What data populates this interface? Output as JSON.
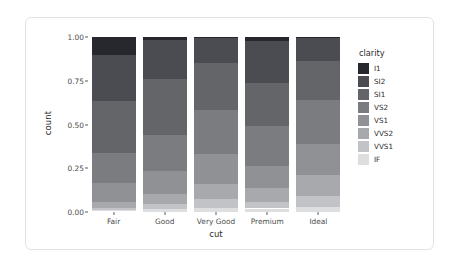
{
  "chart_data": {
    "type": "bar",
    "title": "",
    "subtitle": "",
    "xlabel": "cut",
    "ylabel": "count",
    "categories": [
      "Fair",
      "Good",
      "Very Good",
      "Premium",
      "Ideal"
    ],
    "stacked": true,
    "position": "fill",
    "ylim": [
      0.0,
      1.0
    ],
    "ytick_labels": [
      "0.00",
      "0.25",
      "0.50",
      "0.75",
      "1.00"
    ],
    "ytick_values": [
      0.0,
      0.25,
      0.5,
      0.75,
      1.0
    ],
    "grid": false,
    "legend_title": "clarity",
    "legend_position": "right",
    "series": [
      {
        "name": "I1",
        "color": "#27282d",
        "values": [
          0.104,
          0.015,
          0.008,
          0.021,
          0.007
        ]
      },
      {
        "name": "SI2",
        "color": "#4a4c52",
        "values": [
          0.264,
          0.224,
          0.141,
          0.244,
          0.129
        ]
      },
      {
        "name": "SI1",
        "color": "#646569",
        "values": [
          0.297,
          0.321,
          0.268,
          0.243,
          0.224
        ]
      },
      {
        "name": "VS2",
        "color": "#7b7c80",
        "values": [
          0.169,
          0.205,
          0.251,
          0.229,
          0.254
        ]
      },
      {
        "name": "VS1",
        "color": "#909195",
        "values": [
          0.107,
          0.132,
          0.172,
          0.128,
          0.176
        ]
      },
      {
        "name": "VVS2",
        "color": "#a8a9ad",
        "values": [
          0.035,
          0.056,
          0.086,
          0.079,
          0.12
        ]
      },
      {
        "name": "VVS1",
        "color": "#c2c3c6",
        "values": [
          0.011,
          0.03,
          0.052,
          0.036,
          0.063
        ]
      },
      {
        "name": "IF",
        "color": "#dddee0",
        "values": [
          0.006,
          0.017,
          0.022,
          0.019,
          0.028
        ]
      }
    ],
    "legend_entries": [
      {
        "label": "I1",
        "color": "#27282d"
      },
      {
        "label": "SI2",
        "color": "#4a4c52"
      },
      {
        "label": "SI1",
        "color": "#646569"
      },
      {
        "label": "VS2",
        "color": "#7b7c80"
      },
      {
        "label": "VS1",
        "color": "#909195"
      },
      {
        "label": "VVS2",
        "color": "#a8a9ad"
      },
      {
        "label": "VVS1",
        "color": "#c2c3c6"
      },
      {
        "label": "IF",
        "color": "#dddee0"
      }
    ],
    "xtick_labels": [
      "Fair",
      "Good",
      "Very Good",
      "Premium",
      "Ideal"
    ]
  }
}
